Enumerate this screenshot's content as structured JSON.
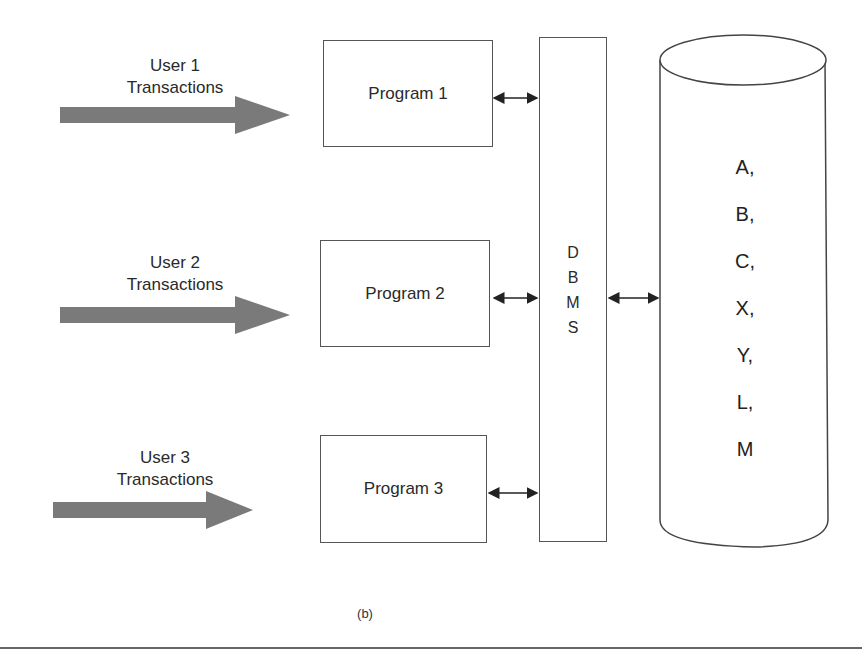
{
  "figure": {
    "caption": "(b)",
    "users": [
      {
        "line1": "User 1",
        "line2": "Transactions"
      },
      {
        "line1": "User 2",
        "line2": "Transactions"
      },
      {
        "line1": "User 3",
        "line2": "Transactions"
      }
    ],
    "programs": [
      {
        "label": "Program 1"
      },
      {
        "label": "Program 2"
      },
      {
        "label": "Program 3"
      }
    ],
    "dbms": {
      "letters": [
        "D",
        "B",
        "M",
        "S"
      ]
    },
    "database": {
      "items": [
        "A,",
        "B,",
        "C,",
        "X,",
        "Y,",
        "L,",
        "M"
      ]
    },
    "colors": {
      "arrow_fill": "#7a7a7a",
      "line": "#555555",
      "text": "#2a2a2a"
    }
  }
}
